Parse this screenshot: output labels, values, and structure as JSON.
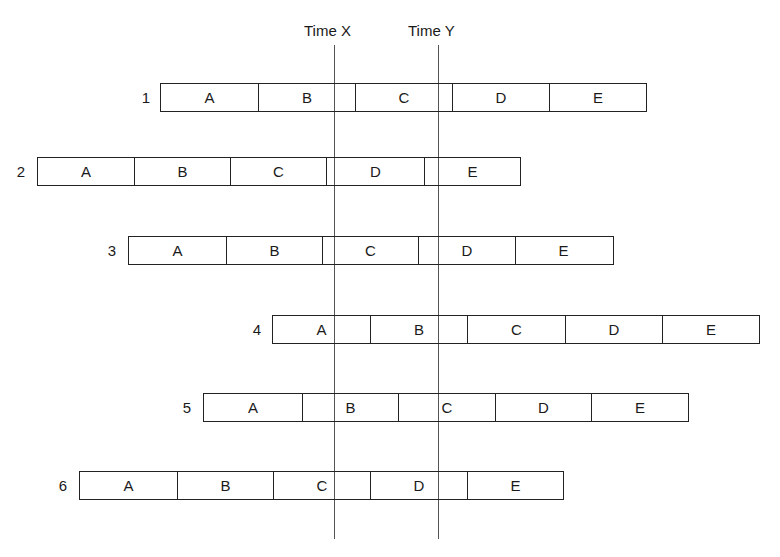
{
  "title": "",
  "time_markers": [
    {
      "label": "Time X",
      "x": 334,
      "label_x": 304
    },
    {
      "label": "Time Y",
      "x": 438,
      "label_x": 408
    }
  ],
  "segment_labels": [
    "A",
    "B",
    "C",
    "D",
    "E"
  ],
  "rows": [
    {
      "number": "1",
      "left": 160,
      "top": 83,
      "segment_width": 97,
      "segments": [
        "A",
        "B",
        "C",
        "D",
        "E"
      ]
    },
    {
      "number": "2",
      "left": 37,
      "top": 157,
      "segment_width": 96,
      "segments": [
        "A",
        "B",
        "C",
        "D",
        "E"
      ]
    },
    {
      "number": "3",
      "left": 128,
      "top": 236,
      "segment_width": 97,
      "segments": [
        "A",
        "B",
        "C",
        "D",
        "E"
      ]
    },
    {
      "number": "4",
      "left": 272,
      "top": 315,
      "segment_width": 97,
      "segments": [
        "A",
        "B",
        "C",
        "D",
        "E"
      ]
    },
    {
      "number": "5",
      "left": 203,
      "top": 393,
      "segment_width": 97,
      "segments": [
        "A",
        "B",
        "C",
        "D",
        "E"
      ]
    },
    {
      "number": "6",
      "left": 79,
      "top": 471,
      "segment_width": 97,
      "segments": [
        "A",
        "B",
        "C",
        "D",
        "E"
      ]
    }
  ]
}
